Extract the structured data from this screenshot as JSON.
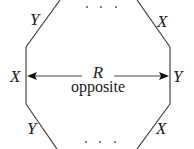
{
  "diagram": {
    "edge_labels": {
      "top_left": "Y",
      "top_right": "X",
      "left_vertical": "X",
      "right_vertical": "Y",
      "bottom_left": "Y",
      "bottom_right": "X"
    },
    "relation": {
      "symbol": "R",
      "caption": "opposite"
    },
    "ellipsis_top": "· · ·",
    "ellipsis_bottom": "· · ·",
    "colors": {
      "line": "#333333",
      "text": "#222222",
      "background": "#ffffff"
    }
  }
}
